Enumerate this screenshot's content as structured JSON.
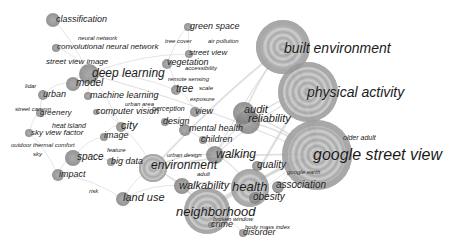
{
  "diagram": {
    "type": "keyword-co-occurrence-network",
    "colors": {
      "background": "#ffffff",
      "node_dark": "#6a6a6a",
      "node_mid": "#9a9a9a",
      "node_light": "#c8c8c8",
      "link": "#d4d4d4",
      "label": "#1a1a1a"
    },
    "nodes": [
      {
        "id": "built-environment",
        "label": "built environment",
        "x": 283,
        "y": 47,
        "r": 27,
        "fs": 14,
        "lx": 284,
        "ly": 41
      },
      {
        "id": "physical-activity",
        "label": "physical activity",
        "x": 308,
        "y": 92,
        "r": 30,
        "fs": 14,
        "lx": 307,
        "ly": 85
      },
      {
        "id": "google-street-view",
        "label": "google street view",
        "x": 317,
        "y": 155,
        "r": 35,
        "fs": 16,
        "lx": 313,
        "ly": 147
      },
      {
        "id": "neighborhood",
        "label": "neighborhood",
        "x": 207,
        "y": 211,
        "r": 23,
        "fs": 13,
        "lx": 176,
        "ly": 205
      },
      {
        "id": "health",
        "label": "health",
        "x": 250,
        "y": 188,
        "r": 19,
        "fs": 13,
        "lx": 232,
        "ly": 180
      },
      {
        "id": "environment",
        "label": "environment",
        "x": 153,
        "y": 168,
        "r": 14,
        "fs": 12,
        "lx": 151,
        "ly": 159
      },
      {
        "id": "walking",
        "label": "walking",
        "x": 215,
        "y": 155,
        "r": 9,
        "fs": 12,
        "lx": 216,
        "ly": 148
      },
      {
        "id": "reliability",
        "label": "reliability",
        "x": 248,
        "y": 122,
        "r": 12,
        "fs": 11,
        "lx": 248,
        "ly": 113
      },
      {
        "id": "audit",
        "label": "audit",
        "x": 244,
        "y": 113,
        "r": 11,
        "fs": 11,
        "lx": 244,
        "ly": 104
      },
      {
        "id": "deep-learning",
        "label": "deep learning",
        "x": 89,
        "y": 74,
        "r": 10,
        "fs": 12,
        "lx": 92,
        "ly": 67
      },
      {
        "id": "walkability",
        "label": "walkability",
        "x": 182,
        "y": 186,
        "r": 8,
        "fs": 11,
        "lx": 179,
        "ly": 180
      },
      {
        "id": "land-use",
        "label": "land use",
        "x": 123,
        "y": 199,
        "r": 7,
        "fs": 11,
        "lx": 123,
        "ly": 192
      },
      {
        "id": "obesity",
        "label": "obesity",
        "x": 255,
        "y": 198,
        "r": 6,
        "fs": 10,
        "lx": 253,
        "ly": 192
      },
      {
        "id": "association",
        "label": "association",
        "x": 278,
        "y": 187,
        "r": 6,
        "fs": 10,
        "lx": 276,
        "ly": 180
      },
      {
        "id": "quality",
        "label": "quality",
        "x": 257,
        "y": 166,
        "r": 5,
        "fs": 10,
        "lx": 257,
        "ly": 160
      },
      {
        "id": "space",
        "label": "space",
        "x": 73,
        "y": 158,
        "r": 8,
        "fs": 10,
        "lx": 77,
        "ly": 152
      },
      {
        "id": "city",
        "label": "city",
        "x": 121,
        "y": 127,
        "r": 5,
        "fs": 11,
        "lx": 121,
        "ly": 120
      },
      {
        "id": "classification",
        "label": "classification",
        "x": 53,
        "y": 20,
        "r": 7,
        "fs": 9,
        "lx": 56,
        "ly": 15
      },
      {
        "id": "model",
        "label": "model",
        "x": 73,
        "y": 84,
        "r": 7,
        "fs": 10,
        "lx": 76,
        "ly": 78
      },
      {
        "id": "mental-health",
        "label": "mental health",
        "x": 185,
        "y": 130,
        "r": 6,
        "fs": 9,
        "lx": 189,
        "ly": 124
      },
      {
        "id": "impact",
        "label": "impact",
        "x": 58,
        "y": 175,
        "r": 6,
        "fs": 9,
        "lx": 59,
        "ly": 170
      },
      {
        "id": "street-view",
        "label": "street view",
        "x": 189,
        "y": 54,
        "r": 4,
        "fs": 8,
        "lx": 189,
        "ly": 49
      },
      {
        "id": "vegetation",
        "label": "vegetation",
        "x": 167,
        "y": 64,
        "r": 5,
        "fs": 9,
        "lx": 167,
        "ly": 58
      },
      {
        "id": "green-space",
        "label": "green space",
        "x": 188,
        "y": 27,
        "r": 4,
        "fs": 9,
        "lx": 190,
        "ly": 22
      },
      {
        "id": "tree",
        "label": "tree",
        "x": 176,
        "y": 90,
        "r": 5,
        "fs": 10,
        "lx": 176,
        "ly": 84
      },
      {
        "id": "view",
        "label": "view",
        "x": 195,
        "y": 112,
        "r": 5,
        "fs": 9,
        "lx": 195,
        "ly": 107
      },
      {
        "id": "design",
        "label": "design",
        "x": 165,
        "y": 122,
        "r": 4,
        "fs": 9,
        "lx": 163,
        "ly": 117
      },
      {
        "id": "children",
        "label": "children",
        "x": 203,
        "y": 140,
        "r": 4,
        "fs": 9,
        "lx": 201,
        "ly": 135
      },
      {
        "id": "urban",
        "label": "urban",
        "x": 43,
        "y": 95,
        "r": 5,
        "fs": 9,
        "lx": 43,
        "ly": 90
      },
      {
        "id": "machine-learning",
        "label": "machine learning",
        "x": 88,
        "y": 96,
        "r": 4,
        "fs": 9,
        "lx": 90,
        "ly": 91
      },
      {
        "id": "computer-vision",
        "label": "computer vision",
        "x": 96,
        "y": 112,
        "r": 3,
        "fs": 9,
        "lx": 96,
        "ly": 107
      },
      {
        "id": "image",
        "label": "image",
        "x": 104,
        "y": 137,
        "r": 4,
        "fs": 9,
        "lx": 104,
        "ly": 131
      },
      {
        "id": "big-data",
        "label": "big data",
        "x": 111,
        "y": 162,
        "r": 4,
        "fs": 9,
        "lx": 111,
        "ly": 157
      },
      {
        "id": "greenery",
        "label": "greenery",
        "x": 40,
        "y": 113,
        "r": 4,
        "fs": 8,
        "lx": 40,
        "ly": 109
      },
      {
        "id": "sky-view-factor",
        "label": "sky view factor",
        "x": 29,
        "y": 133,
        "r": 4,
        "fs": 8,
        "lx": 31,
        "ly": 129
      },
      {
        "id": "convolutional-neural-network",
        "label": "convolutional neural network",
        "x": 56,
        "y": 48,
        "r": 4,
        "fs": 8,
        "lx": 57,
        "ly": 43
      },
      {
        "id": "disorder",
        "label": "disorder",
        "x": 243,
        "y": 233,
        "r": 4,
        "fs": 9,
        "lx": 243,
        "ly": 228
      },
      {
        "id": "crime",
        "label": "crime",
        "x": 211,
        "y": 225,
        "r": 3,
        "fs": 9,
        "lx": 211,
        "ly": 220
      }
    ],
    "minor_labels": [
      {
        "id": "neural-network",
        "label": "neural network",
        "lx": 78,
        "ly": 35,
        "fs": 6
      },
      {
        "id": "street-view-image",
        "label": "street view image",
        "lx": 46,
        "ly": 58,
        "fs": 8
      },
      {
        "id": "tree-cover",
        "label": "tree cover",
        "lx": 165,
        "ly": 38,
        "fs": 6
      },
      {
        "id": "air-pollution",
        "label": "air pollution",
        "lx": 208,
        "ly": 38,
        "fs": 6
      },
      {
        "id": "accessibility",
        "label": "accessibility",
        "lx": 185,
        "ly": 65,
        "fs": 6
      },
      {
        "id": "remote-sensing",
        "label": "remote sensing",
        "lx": 168,
        "ly": 76,
        "fs": 6
      },
      {
        "id": "scale",
        "label": "scale",
        "lx": 199,
        "ly": 85,
        "fs": 6
      },
      {
        "id": "exposure",
        "label": "exposure",
        "lx": 190,
        "ly": 96,
        "fs": 6
      },
      {
        "id": "perception",
        "label": "perception",
        "lx": 152,
        "ly": 105,
        "fs": 7
      },
      {
        "id": "urban-area",
        "label": "urban area",
        "lx": 125,
        "ly": 101,
        "fs": 6
      },
      {
        "id": "lidar",
        "label": "lidar",
        "lx": 25,
        "ly": 83,
        "fs": 6
      },
      {
        "id": "street-canyon",
        "label": "street canyon",
        "lx": 15,
        "ly": 106,
        "fs": 6
      },
      {
        "id": "heat-island",
        "label": "heat island",
        "lx": 52,
        "ly": 122,
        "fs": 7
      },
      {
        "id": "outdoor-thermal-comfort",
        "label": "outdoor thermal comfort",
        "lx": 11,
        "ly": 142,
        "fs": 6
      },
      {
        "id": "sky",
        "label": "sky",
        "lx": 33,
        "ly": 151,
        "fs": 6
      },
      {
        "id": "feature",
        "label": "feature",
        "lx": 107,
        "ly": 147,
        "fs": 6
      },
      {
        "id": "urban-design",
        "label": "urban design",
        "lx": 167,
        "ly": 152,
        "fs": 6
      },
      {
        "id": "adult",
        "label": "adult",
        "lx": 197,
        "ly": 171,
        "fs": 6
      },
      {
        "id": "risk",
        "label": "risk",
        "lx": 89,
        "ly": 188,
        "fs": 6
      },
      {
        "id": "older-adult",
        "label": "older adult",
        "lx": 343,
        "ly": 134,
        "fs": 7
      },
      {
        "id": "google-earth",
        "label": "google earth",
        "lx": 287,
        "ly": 169,
        "fs": 6
      },
      {
        "id": "broken-window",
        "label": "broken window",
        "lx": 213,
        "ly": 216,
        "fs": 6
      },
      {
        "id": "body-mass-index",
        "label": "body mass index",
        "lx": 245,
        "ly": 224,
        "fs": 6
      }
    ],
    "links": [
      [
        "built-environment",
        "physical-activity"
      ],
      [
        "built-environment",
        "google-street-view"
      ],
      [
        "physical-activity",
        "google-street-view"
      ],
      [
        "built-environment",
        "audit"
      ],
      [
        "physical-activity",
        "reliability"
      ],
      [
        "physical-activity",
        "walking"
      ],
      [
        "physical-activity",
        "health"
      ],
      [
        "google-street-view",
        "health"
      ],
      [
        "google-street-view",
        "neighborhood"
      ],
      [
        "google-street-view",
        "reliability"
      ],
      [
        "google-street-view",
        "audit"
      ],
      [
        "google-street-view",
        "association"
      ],
      [
        "google-street-view",
        "obesity"
      ],
      [
        "google-street-view",
        "environment"
      ],
      [
        "google-street-view",
        "deep-learning"
      ],
      [
        "neighborhood",
        "health"
      ],
      [
        "neighborhood",
        "walkability"
      ],
      [
        "neighborhood",
        "crime"
      ],
      [
        "neighborhood",
        "disorder"
      ],
      [
        "neighborhood",
        "environment"
      ],
      [
        "health",
        "walkability"
      ],
      [
        "health",
        "walking"
      ],
      [
        "health",
        "obesity"
      ],
      [
        "environment",
        "land-use"
      ],
      [
        "environment",
        "big-data"
      ],
      [
        "environment",
        "walking"
      ],
      [
        "environment",
        "city"
      ],
      [
        "walking",
        "reliability"
      ],
      [
        "walking",
        "mental-health"
      ],
      [
        "deep-learning",
        "model"
      ],
      [
        "deep-learning",
        "classification"
      ],
      [
        "deep-learning",
        "convolutional-neural-network"
      ],
      [
        "deep-learning",
        "machine-learning"
      ],
      [
        "deep-learning",
        "street-view"
      ],
      [
        "deep-learning",
        "tree"
      ],
      [
        "deep-learning",
        "city"
      ],
      [
        "model",
        "urban"
      ],
      [
        "urban",
        "greenery"
      ],
      [
        "greenery",
        "sky-view-factor"
      ],
      [
        "sky-view-factor",
        "impact"
      ],
      [
        "space",
        "impact"
      ],
      [
        "space",
        "big-data"
      ],
      [
        "space",
        "image"
      ],
      [
        "city",
        "image"
      ],
      [
        "computer-vision",
        "city"
      ],
      [
        "vegetation",
        "green-space"
      ],
      [
        "vegetation",
        "tree"
      ],
      [
        "street-view",
        "green-space"
      ],
      [
        "tree",
        "view"
      ],
      [
        "view",
        "mental-health"
      ],
      [
        "design",
        "mental-health"
      ],
      [
        "children",
        "walking"
      ],
      [
        "land-use",
        "walkability"
      ],
      [
        "audit",
        "reliability"
      ],
      [
        "built-environment",
        "walking"
      ],
      [
        "built-environment",
        "environment"
      ],
      [
        "quality",
        "health"
      ],
      [
        "impact",
        "land-use"
      ]
    ]
  }
}
